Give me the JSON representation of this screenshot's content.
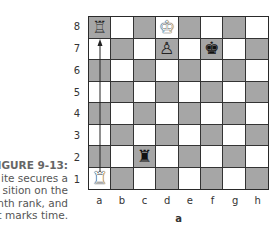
{
  "caption": {
    "figure_label": "FIGURE 9-13:",
    "lines": [
      "ite secures a",
      "sition on the",
      "nth rank, and",
      "t marks time."
    ]
  },
  "board": {
    "ranks": [
      "8",
      "7",
      "6",
      "5",
      "4",
      "3",
      "2",
      "1"
    ],
    "files": [
      "a",
      "b",
      "c",
      "d",
      "e",
      "f",
      "g",
      "h"
    ],
    "sublabel": "a",
    "colors": {
      "light": "#ffffff",
      "dark": "#a6a6a6",
      "grid": "#333333"
    },
    "pieces": [
      {
        "square": "a8",
        "piece": "rook",
        "color": "white",
        "glyph": "♖",
        "note": "destination"
      },
      {
        "square": "d8",
        "piece": "king",
        "color": "white",
        "glyph": "♚"
      },
      {
        "square": "d7",
        "piece": "pawn",
        "color": "white",
        "glyph": "♙"
      },
      {
        "square": "f7",
        "piece": "king",
        "color": "black",
        "glyph": "♚"
      },
      {
        "square": "c2",
        "piece": "rook",
        "color": "black",
        "glyph": "♜"
      },
      {
        "square": "a1",
        "piece": "rook",
        "color": "white",
        "glyph": "♜"
      }
    ],
    "arrow": {
      "from": "a1",
      "to": "a7"
    }
  }
}
